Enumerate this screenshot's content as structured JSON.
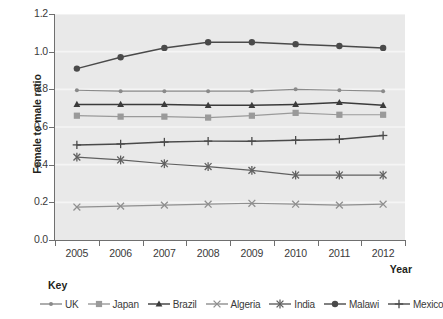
{
  "chart_data": {
    "type": "line",
    "title": "",
    "xlabel": "Year",
    "ylabel": "Female to male ratio",
    "categories": [
      "2005",
      "2006",
      "2007",
      "2008",
      "2009",
      "2010",
      "2011",
      "2012"
    ],
    "x": [
      2005,
      2006,
      2007,
      2008,
      2009,
      2010,
      2011,
      2012
    ],
    "ylim": [
      0.0,
      1.2
    ],
    "yticks": [
      "0.0",
      "0.2",
      "0.4",
      "0.6",
      "0.8",
      "1.0",
      "1.2"
    ],
    "ytick_values": [
      0.0,
      0.2,
      0.4,
      0.6,
      0.8,
      1.0,
      1.2
    ],
    "grid": true,
    "legend_position": "bottom",
    "legend_title": "Key",
    "series": [
      {
        "name": "UK",
        "marker": "circle-small",
        "color": "#8a8a8a",
        "values": [
          0.795,
          0.79,
          0.79,
          0.79,
          0.79,
          0.8,
          0.795,
          0.79
        ]
      },
      {
        "name": "Japan",
        "marker": "square",
        "color": "#9a9a9a",
        "values": [
          0.66,
          0.655,
          0.655,
          0.65,
          0.66,
          0.675,
          0.665,
          0.665
        ]
      },
      {
        "name": "Brazil",
        "marker": "triangle",
        "color": "#3b3b3b",
        "values": [
          0.72,
          0.72,
          0.72,
          0.715,
          0.715,
          0.72,
          0.73,
          0.715
        ]
      },
      {
        "name": "Algeria",
        "marker": "x",
        "color": "#8f8f8f",
        "values": [
          0.175,
          0.18,
          0.185,
          0.19,
          0.195,
          0.19,
          0.185,
          0.19
        ]
      },
      {
        "name": "India",
        "marker": "asterisk",
        "color": "#606060",
        "values": [
          0.44,
          0.425,
          0.405,
          0.39,
          0.37,
          0.345,
          0.345,
          0.345
        ]
      },
      {
        "name": "Malawi",
        "marker": "circle",
        "color": "#4a4a4a",
        "values": [
          0.91,
          0.97,
          1.02,
          1.05,
          1.05,
          1.04,
          1.03,
          1.02
        ]
      },
      {
        "name": "Mexico",
        "marker": "plus",
        "color": "#4a4a4a",
        "values": [
          0.505,
          0.51,
          0.52,
          0.525,
          0.525,
          0.53,
          0.535,
          0.555
        ]
      }
    ]
  },
  "axes": {
    "y_title": "Female to male ratio",
    "x_title": "Year"
  },
  "legend": {
    "title": "Key",
    "items": [
      {
        "label": "UK"
      },
      {
        "label": "Japan"
      },
      {
        "label": "Brazil"
      },
      {
        "label": "Algeria"
      },
      {
        "label": "India"
      },
      {
        "label": "Malawi"
      },
      {
        "label": "Mexico"
      }
    ]
  },
  "colors": {
    "plot_background": "#e9e9e9",
    "gridline": "#f5f5f5",
    "axis": "#6f6f6f",
    "text": "#3a3a3a"
  }
}
